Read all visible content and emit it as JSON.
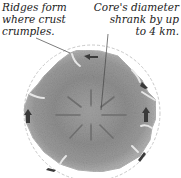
{
  "annotations": {
    "left": {
      "lines": [
        "Ridges form",
        "where crust",
        "crumples."
      ]
    },
    "right": {
      "lines": [
        "Core's diameter",
        "shrank by up",
        "to 4 km."
      ]
    }
  },
  "figure": {
    "outer_ring": "dashed-original-surface",
    "arrow_direction": "inward",
    "colors": {
      "surface": "#8a8a8a",
      "core": "#9c9c9c",
      "ridge": "#e0e0e0",
      "arrow": "#3a3a3a",
      "outline": "#bdbdbd"
    }
  }
}
